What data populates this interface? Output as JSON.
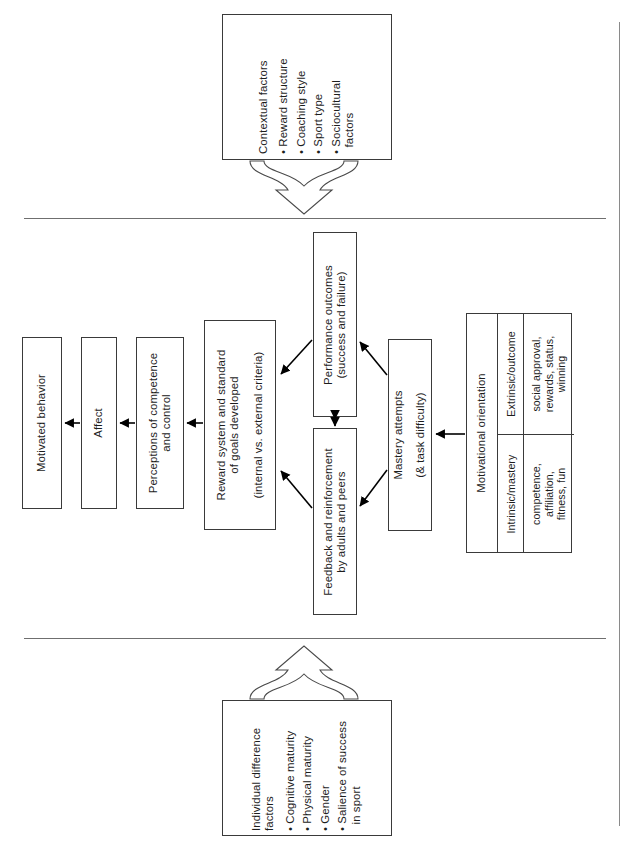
{
  "figure": {
    "orientation": "text rotated 90 degrees counter-clockwise",
    "background_color": "#ffffff",
    "line_color": "#3a3a3a",
    "rule_color": "#6f6f6f"
  },
  "sections": {
    "top_rule_label": "section-divider-top",
    "bottom_rule_label": "section-divider-bottom",
    "right_rule_label": "page-edge-rule"
  },
  "boxes": {
    "contextual": {
      "heading": "Contextual factors",
      "items": [
        "• Reward structure",
        "• Coaching style",
        "• Sport type",
        "• Sociocultural\n  factors"
      ]
    },
    "individual": {
      "heading": "Individual difference\nfactors",
      "items": [
        "• Cognitive maturity",
        "• Physical maturity",
        "• Gender",
        "• Salience of success\n  in sport"
      ]
    },
    "motivated_behavior": {
      "label": "Motivated behavior"
    },
    "affect": {
      "label": "Affect"
    },
    "perceptions": {
      "label": "Perceptions of competence\nand control"
    },
    "reward_system": {
      "line1": "Reward system and standard",
      "line2": "of goals developed",
      "line3": "(internal vs. external criteria)"
    },
    "performance_outcomes": {
      "line1": "Performance outcomes",
      "line2": "(success and failure)"
    },
    "feedback": {
      "line1": "Feedback and reinforcement",
      "line2": "by adults and peers"
    },
    "mastery": {
      "line1": "Mastery attempts",
      "line2": "(& task difficulty)"
    },
    "motivational_orientation": {
      "heading": "Motivational orientation",
      "columns": [
        {
          "name": "Extrinsic/outcome",
          "detail": "social approval,\nrewards, status,\nwinning"
        },
        {
          "name": "Intrinsic/mastery",
          "detail": "competence,\naffiliation,\nfitness, fun"
        }
      ]
    }
  },
  "connectors": [
    {
      "name": "contextual-to-middle",
      "style": "hollow-block-arrow",
      "direction": "down"
    },
    {
      "name": "individual-to-middle",
      "style": "hollow-block-arrow",
      "direction": "up"
    },
    {
      "name": "affect-to-motivated-behavior",
      "style": "solid-arrow",
      "direction": "left"
    },
    {
      "name": "perceptions-to-affect",
      "style": "solid-arrow",
      "direction": "left"
    },
    {
      "name": "reward-system-to-perceptions",
      "style": "solid-arrow",
      "direction": "left"
    },
    {
      "name": "performance-outcomes-to-reward-system",
      "style": "solid-arrow",
      "direction": "diagonal-left"
    },
    {
      "name": "feedback-to-reward-system",
      "style": "solid-arrow",
      "direction": "diagonal-left"
    },
    {
      "name": "performance-outcomes-feedback",
      "style": "solid-double-arrow",
      "direction": "vertical"
    },
    {
      "name": "mastery-to-performance-outcomes",
      "style": "solid-arrow",
      "direction": "diagonal-up-left"
    },
    {
      "name": "mastery-to-feedback",
      "style": "solid-arrow",
      "direction": "diagonal-down-left"
    },
    {
      "name": "motivational-orientation-to-mastery",
      "style": "solid-arrow",
      "direction": "left"
    }
  ]
}
